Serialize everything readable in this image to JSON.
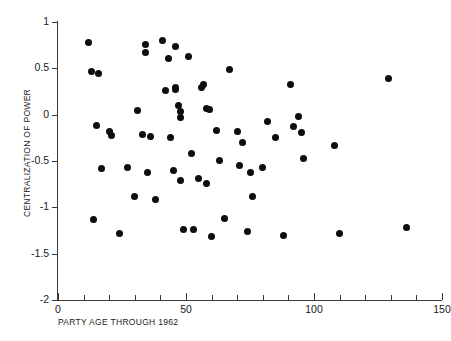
{
  "chart_data": {
    "type": "scatter",
    "title": "FIGURE 4.2   Centralization of Power",
    "xlabel": "PARTY AGE THROUGH 1962",
    "ylabel": "CENTRALIZATION OF POWER",
    "xlim": [
      0,
      150
    ],
    "ylim": [
      -2,
      1
    ],
    "xticks": [
      0,
      50,
      100,
      150
    ],
    "xtick_labels": [
      "0",
      "50",
      "100",
      "150"
    ],
    "xminor_ticks": [
      10,
      20,
      30,
      40,
      60,
      70,
      80,
      90,
      110,
      120,
      130,
      140
    ],
    "yticks": [
      1,
      0.5,
      0,
      -0.5,
      -1,
      -1.5,
      -2
    ],
    "ytick_labels": [
      "1",
      "0.5",
      "0",
      "-0.5",
      "-1",
      "-1.5",
      "-2"
    ],
    "grid": false,
    "legend": null,
    "marker": "filled-circle",
    "marker_color": "#0d0d0d",
    "marker_size_px": 7,
    "n_points": 63,
    "points": [
      {
        "x": 12,
        "y": 0.78
      },
      {
        "x": 13,
        "y": 0.47
      },
      {
        "x": 16,
        "y": 0.44
      },
      {
        "x": 15,
        "y": -0.12
      },
      {
        "x": 17,
        "y": -0.58
      },
      {
        "x": 14,
        "y": -1.13
      },
      {
        "x": 20,
        "y": -0.18
      },
      {
        "x": 21,
        "y": -0.23
      },
      {
        "x": 24,
        "y": -1.28
      },
      {
        "x": 27,
        "y": -0.57
      },
      {
        "x": 30,
        "y": -0.88
      },
      {
        "x": 31,
        "y": 0.04
      },
      {
        "x": 33,
        "y": -0.21
      },
      {
        "x": 34,
        "y": 0.76
      },
      {
        "x": 34,
        "y": 0.67
      },
      {
        "x": 35,
        "y": -0.62
      },
      {
        "x": 36,
        "y": -0.24
      },
      {
        "x": 38,
        "y": -0.92
      },
      {
        "x": 41,
        "y": 0.8
      },
      {
        "x": 42,
        "y": 0.26
      },
      {
        "x": 43,
        "y": 0.61
      },
      {
        "x": 44,
        "y": -0.25
      },
      {
        "x": 45,
        "y": -0.6
      },
      {
        "x": 46,
        "y": 0.74
      },
      {
        "x": 46,
        "y": 0.29
      },
      {
        "x": 46,
        "y": 0.27
      },
      {
        "x": 47,
        "y": 0.1
      },
      {
        "x": 48,
        "y": 0.03
      },
      {
        "x": 48,
        "y": -0.03
      },
      {
        "x": 48,
        "y": -0.71
      },
      {
        "x": 49,
        "y": -1.24
      },
      {
        "x": 51,
        "y": 0.63
      },
      {
        "x": 52,
        "y": -0.42
      },
      {
        "x": 53,
        "y": -1.24
      },
      {
        "x": 55,
        "y": -0.69
      },
      {
        "x": 56,
        "y": 0.29
      },
      {
        "x": 57,
        "y": 0.33
      },
      {
        "x": 58,
        "y": 0.07
      },
      {
        "x": 58,
        "y": -0.74
      },
      {
        "x": 59,
        "y": 0.06
      },
      {
        "x": 60,
        "y": -1.32
      },
      {
        "x": 62,
        "y": -0.17
      },
      {
        "x": 63,
        "y": -0.49
      },
      {
        "x": 65,
        "y": -1.12
      },
      {
        "x": 67,
        "y": 0.49
      },
      {
        "x": 70,
        "y": -0.18
      },
      {
        "x": 71,
        "y": -0.55
      },
      {
        "x": 72,
        "y": -0.3
      },
      {
        "x": 74,
        "y": -1.26
      },
      {
        "x": 75,
        "y": -0.62
      },
      {
        "x": 76,
        "y": -0.88
      },
      {
        "x": 80,
        "y": -0.57
      },
      {
        "x": 82,
        "y": -0.07
      },
      {
        "x": 85,
        "y": -0.25
      },
      {
        "x": 88,
        "y": -1.3
      },
      {
        "x": 91,
        "y": 0.33
      },
      {
        "x": 92,
        "y": -0.13
      },
      {
        "x": 94,
        "y": -0.02
      },
      {
        "x": 95,
        "y": -0.19
      },
      {
        "x": 96,
        "y": -0.47
      },
      {
        "x": 108,
        "y": -0.33
      },
      {
        "x": 110,
        "y": -1.28
      },
      {
        "x": 129,
        "y": 0.39
      },
      {
        "x": 136,
        "y": -1.22
      }
    ]
  },
  "axis": {
    "y_title": "CENTRALIZATION OF POWER",
    "x_title": "PARTY AGE THROUGH 1962",
    "title_text": "FIGURE 4.2   Centralization of Power"
  }
}
